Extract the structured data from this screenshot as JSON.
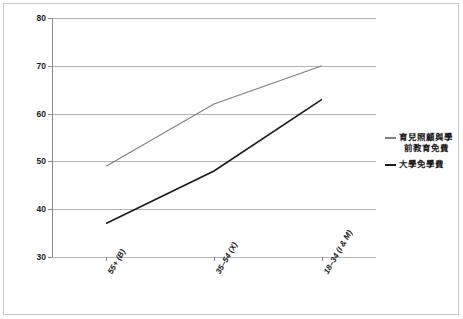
{
  "chart_data": {
    "type": "line",
    "title": "",
    "xlabel": "",
    "ylabel": "",
    "ylim": [
      30,
      80
    ],
    "yticks": [
      30,
      40,
      50,
      60,
      70,
      80
    ],
    "grid": true,
    "legend_position": "right",
    "categories": [
      "55+ (B)",
      "35–54 (X)",
      "18–34 (I & M)"
    ],
    "series": [
      {
        "name": "育兒照顧與學前教育免費",
        "name_line1": "育兒照顧與學",
        "name_line2": "前教育免費",
        "color": "#808080",
        "values": [
          49,
          62,
          70
        ]
      },
      {
        "name": "大學免學費",
        "name_line1": "大學免學費",
        "name_line2": "",
        "color": "#1a1a1a",
        "values": [
          37,
          48,
          63
        ]
      }
    ]
  },
  "axis": {
    "y_labels": [
      "80",
      "70",
      "60",
      "50",
      "40",
      "30"
    ],
    "x_labels": [
      "55+ (B)",
      "35–54 (X)",
      "18–34 (I & M)"
    ]
  },
  "legend": {
    "entries": [
      {
        "line1": "育兒照顧與學",
        "line2": "前教育免費",
        "color": "#808080"
      },
      {
        "line1": "大學免學費",
        "line2": "",
        "color": "#1a1a1a"
      }
    ]
  },
  "colors": {
    "gridline": "#b4b4b4",
    "axis": "#8a8a8a",
    "border": "#c9c9c9",
    "text": "#1a1a1a",
    "background": "#ffffff"
  }
}
